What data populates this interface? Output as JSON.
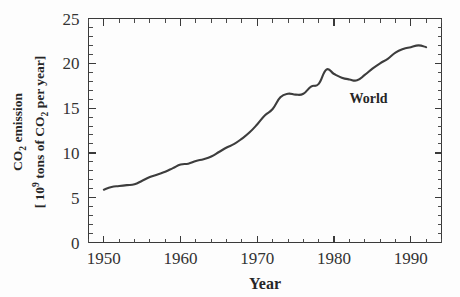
{
  "chart_data": {
    "type": "line",
    "title": "",
    "xlabel": "Year",
    "ylabel_line1": "CO₂  emission",
    "ylabel_line2": "[ 10⁹ tons of CO₂ per year]",
    "ylabel_line1_parts": {
      "base": "CO",
      "sub": "2",
      "rest": "  emission"
    },
    "ylabel_line2_parts": {
      "prefix": "[ 10",
      "sup": "9",
      "mid": " tons of CO",
      "sub": "2",
      "suffix": " per year]"
    },
    "xlim": [
      1948,
      1994
    ],
    "ylim": [
      0,
      25
    ],
    "grid": false,
    "legend_position": "none",
    "x_major_ticks": [
      1950,
      1960,
      1970,
      1980,
      1990
    ],
    "x_tick_labels": [
      "1950",
      "1960",
      "1970",
      "1980",
      "1990"
    ],
    "x_minor_tick_interval": 2,
    "y_major_ticks": [
      0,
      5,
      10,
      15,
      20,
      25
    ],
    "y_tick_labels": [
      "0",
      "5",
      "10",
      "15",
      "20",
      "25"
    ],
    "y_minor_tick_interval": 1,
    "annotations": [
      {
        "text": "World",
        "x": 1984.5,
        "y": 15.6
      }
    ],
    "series": [
      {
        "name": "World",
        "x": [
          1950,
          1951,
          1952,
          1953,
          1954,
          1955,
          1956,
          1957,
          1958,
          1959,
          1960,
          1961,
          1962,
          1963,
          1964,
          1965,
          1966,
          1967,
          1968,
          1969,
          1970,
          1971,
          1972,
          1973,
          1974,
          1975,
          1976,
          1977,
          1978,
          1979,
          1980,
          1981,
          1982,
          1983,
          1984,
          1985,
          1986,
          1987,
          1988,
          1989,
          1990,
          1991,
          1992
        ],
        "values": [
          5.9,
          6.2,
          6.3,
          6.4,
          6.5,
          6.9,
          7.3,
          7.6,
          7.9,
          8.3,
          8.7,
          8.8,
          9.1,
          9.3,
          9.6,
          10.1,
          10.6,
          11.0,
          11.6,
          12.3,
          13.2,
          14.2,
          14.9,
          16.2,
          16.6,
          16.5,
          16.6,
          17.4,
          17.7,
          19.3,
          18.8,
          18.4,
          18.2,
          18.1,
          18.7,
          19.4,
          20.0,
          20.5,
          21.2,
          21.6,
          21.8,
          22.0,
          21.8
        ]
      }
    ]
  },
  "figure": {
    "background_color": "#fdfdfd",
    "line_color": "#3d3d3d",
    "axis_color": "#3a3a3a",
    "text_color": "#262626"
  }
}
